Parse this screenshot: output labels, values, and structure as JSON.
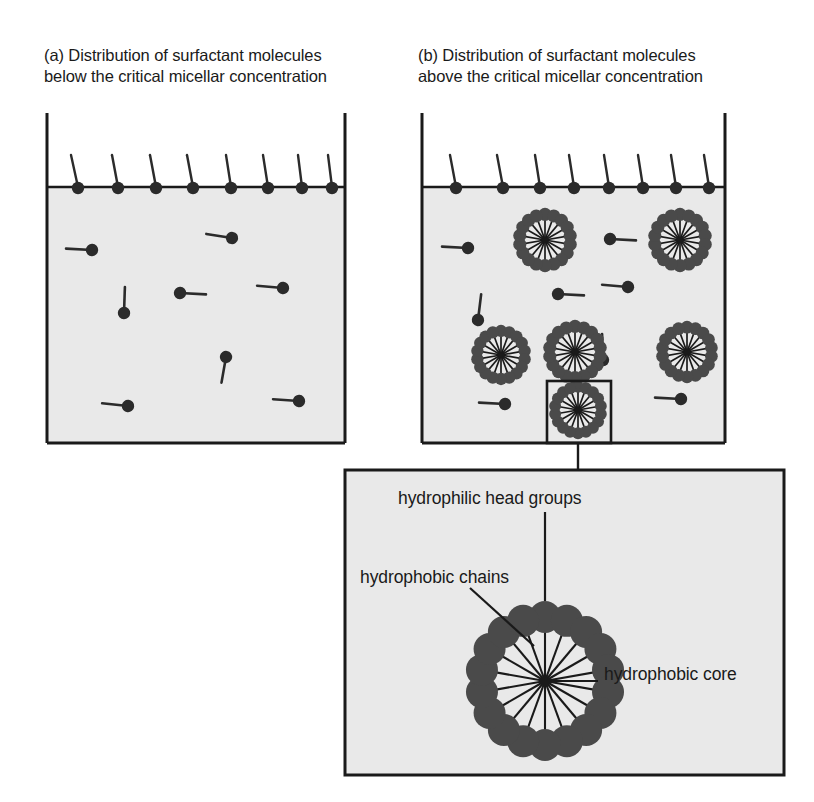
{
  "figure": {
    "colors": {
      "liquid_fill": "#e9e9e9",
      "outline": "#1a1a1a",
      "molecule": "#2b2b2b",
      "micelle_head": "#4a4a4a",
      "background": "#ffffff"
    }
  },
  "panels": {
    "a": {
      "caption": "(a) Distribution of surfactant molecules\nbelow the critical micellar concentration",
      "box": {
        "x": 47,
        "y": 113,
        "width": 298,
        "height": 330
      },
      "waterline_y": 187,
      "surface_molecule_count": 8,
      "free_molecule_count": 8,
      "micelle_count": 0,
      "surface_molecules": [
        {
          "x": 78,
          "tilt": -7
        },
        {
          "x": 118,
          "tilt": -6
        },
        {
          "x": 156,
          "tilt": -8
        },
        {
          "x": 193,
          "tilt": -7
        },
        {
          "x": 231,
          "tilt": -6
        },
        {
          "x": 268,
          "tilt": -6
        },
        {
          "x": 302,
          "tilt": -5
        },
        {
          "x": 332,
          "tilt": -6
        }
      ],
      "free_molecules": [
        {
          "hx": 92,
          "hy": 250,
          "angle": 183
        },
        {
          "hx": 232,
          "hy": 238,
          "angle": 189
        },
        {
          "hx": 124,
          "hy": 313,
          "angle": 272
        },
        {
          "hx": 180,
          "hy": 293,
          "angle": 3
        },
        {
          "hx": 283,
          "hy": 288,
          "angle": 185
        },
        {
          "hx": 226,
          "hy": 357,
          "angle": 100
        },
        {
          "hx": 128,
          "hy": 406,
          "angle": 186
        },
        {
          "hx": 299,
          "hy": 401,
          "angle": 184
        }
      ]
    },
    "b": {
      "caption": "(b) Distribution of surfactant molecules\nabove the critical micellar concentration",
      "box": {
        "x": 422,
        "y": 113,
        "width": 303,
        "height": 330
      },
      "waterline_y": 187,
      "surface_molecule_count": 8,
      "free_molecule_count": 8,
      "micelle_count": 7,
      "surface_molecules": [
        {
          "x": 456,
          "tilt": -7
        },
        {
          "x": 503,
          "tilt": -7
        },
        {
          "x": 540,
          "tilt": -6
        },
        {
          "x": 574,
          "tilt": -6
        },
        {
          "x": 609,
          "tilt": -6
        },
        {
          "x": 643,
          "tilt": -6
        },
        {
          "x": 676,
          "tilt": -6
        },
        {
          "x": 709,
          "tilt": -6
        }
      ],
      "free_molecules": [
        {
          "hx": 468,
          "hy": 248,
          "angle": 183
        },
        {
          "hx": 610,
          "hy": 239,
          "angle": 3
        },
        {
          "hx": 478,
          "hy": 320,
          "angle": 277
        },
        {
          "hx": 558,
          "hy": 294,
          "angle": 3
        },
        {
          "hx": 628,
          "hy": 287,
          "angle": 185
        },
        {
          "hx": 603,
          "hy": 360,
          "angle": 268
        },
        {
          "hx": 505,
          "hy": 404,
          "angle": 183
        },
        {
          "hx": 681,
          "hy": 399,
          "angle": 183
        }
      ],
      "micelles": [
        {
          "cx": 501,
          "cy": 355,
          "r": 30,
          "boxed": false
        },
        {
          "cx": 575,
          "cy": 352,
          "r": 32,
          "boxed": false
        },
        {
          "cx": 687,
          "cy": 352,
          "r": 31,
          "boxed": false
        },
        {
          "cx": 545,
          "cy": 240,
          "r": 32,
          "boxed": false
        },
        {
          "cx": 680,
          "cy": 240,
          "r": 32,
          "boxed": false
        },
        {
          "cx": 578,
          "cy": 410,
          "r": 29,
          "boxed": true
        }
      ],
      "highlight_box": {
        "x": 547,
        "y": 381,
        "width": 64,
        "height": 62
      }
    },
    "detail": {
      "box": {
        "x": 345,
        "y": 470,
        "width": 439,
        "height": 305
      },
      "micelle": {
        "cx": 545,
        "cy": 681,
        "head_radius": 16,
        "ring_radius": 64,
        "head_count": 18,
        "chain_count": 18
      },
      "connector": {
        "from_x": 578,
        "from_y": 443,
        "to_y": 470
      }
    }
  },
  "annotations": {
    "heads": {
      "text": "hydrophilic head groups",
      "leader": {
        "x1": 545,
        "y1": 512,
        "x2": 545,
        "y2": 600
      }
    },
    "chains": {
      "text": "hydrophobic chains",
      "leader": {
        "x1": 470,
        "y1": 588,
        "x2": 533,
        "y2": 645
      }
    },
    "core": {
      "text": "hydrophobic core",
      "leader": {
        "x1": 598,
        "y1": 681,
        "x2": 545,
        "y2": 681
      }
    }
  }
}
